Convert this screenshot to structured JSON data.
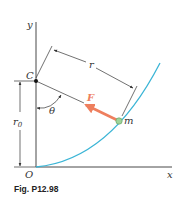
{
  "figure": {
    "caption": "Fig. P12.98",
    "labels": {
      "y_axis": "y",
      "x_axis": "x",
      "origin": "O",
      "point_c": "C",
      "distance_r": "r",
      "distance_r0": "r",
      "distance_r0_sub": "0",
      "angle": "θ",
      "force": "F",
      "mass": "m"
    },
    "colors": {
      "curve": "#3bb5d6",
      "force_arrow": "#ee7f5e",
      "force_label": "#ee7f5e",
      "mass_fill": "#9fd39a",
      "lines": "#333333"
    }
  }
}
